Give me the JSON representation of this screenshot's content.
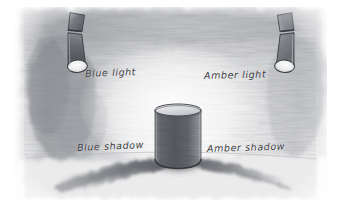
{
  "illustration": {
    "title": "Blue and amber light casting coloured shadows on a cylinder",
    "medium": "pencil sketch",
    "paper_color": "#ffffff",
    "graphite_color": "#6f7176"
  },
  "labels": {
    "blue_light": "Blue light",
    "amber_light": "Amber light",
    "blue_shadow": "Blue shadow",
    "amber_shadow": "Amber shadow"
  },
  "objects": {
    "left_lamp": {
      "name": "Blue light lamp",
      "shape": "cone spotlight",
      "aim": "down-right"
    },
    "right_lamp": {
      "name": "Amber light lamp",
      "shape": "cone spotlight",
      "aim": "down-left"
    },
    "cylinder": {
      "name": "Cylinder",
      "shape": "upright cylinder with elliptical top"
    },
    "left_shadow": {
      "name": "Blue shadow",
      "direction": "down-left"
    },
    "right_shadow": {
      "name": "Amber shadow",
      "direction": "down-right"
    }
  },
  "colors": {
    "graphite_dark": "#4a4c51",
    "graphite_mid": "#8b8d92",
    "graphite_light": "#c9cacd",
    "shadow_core": "#5d6066",
    "ink": "#3b3b3f"
  }
}
